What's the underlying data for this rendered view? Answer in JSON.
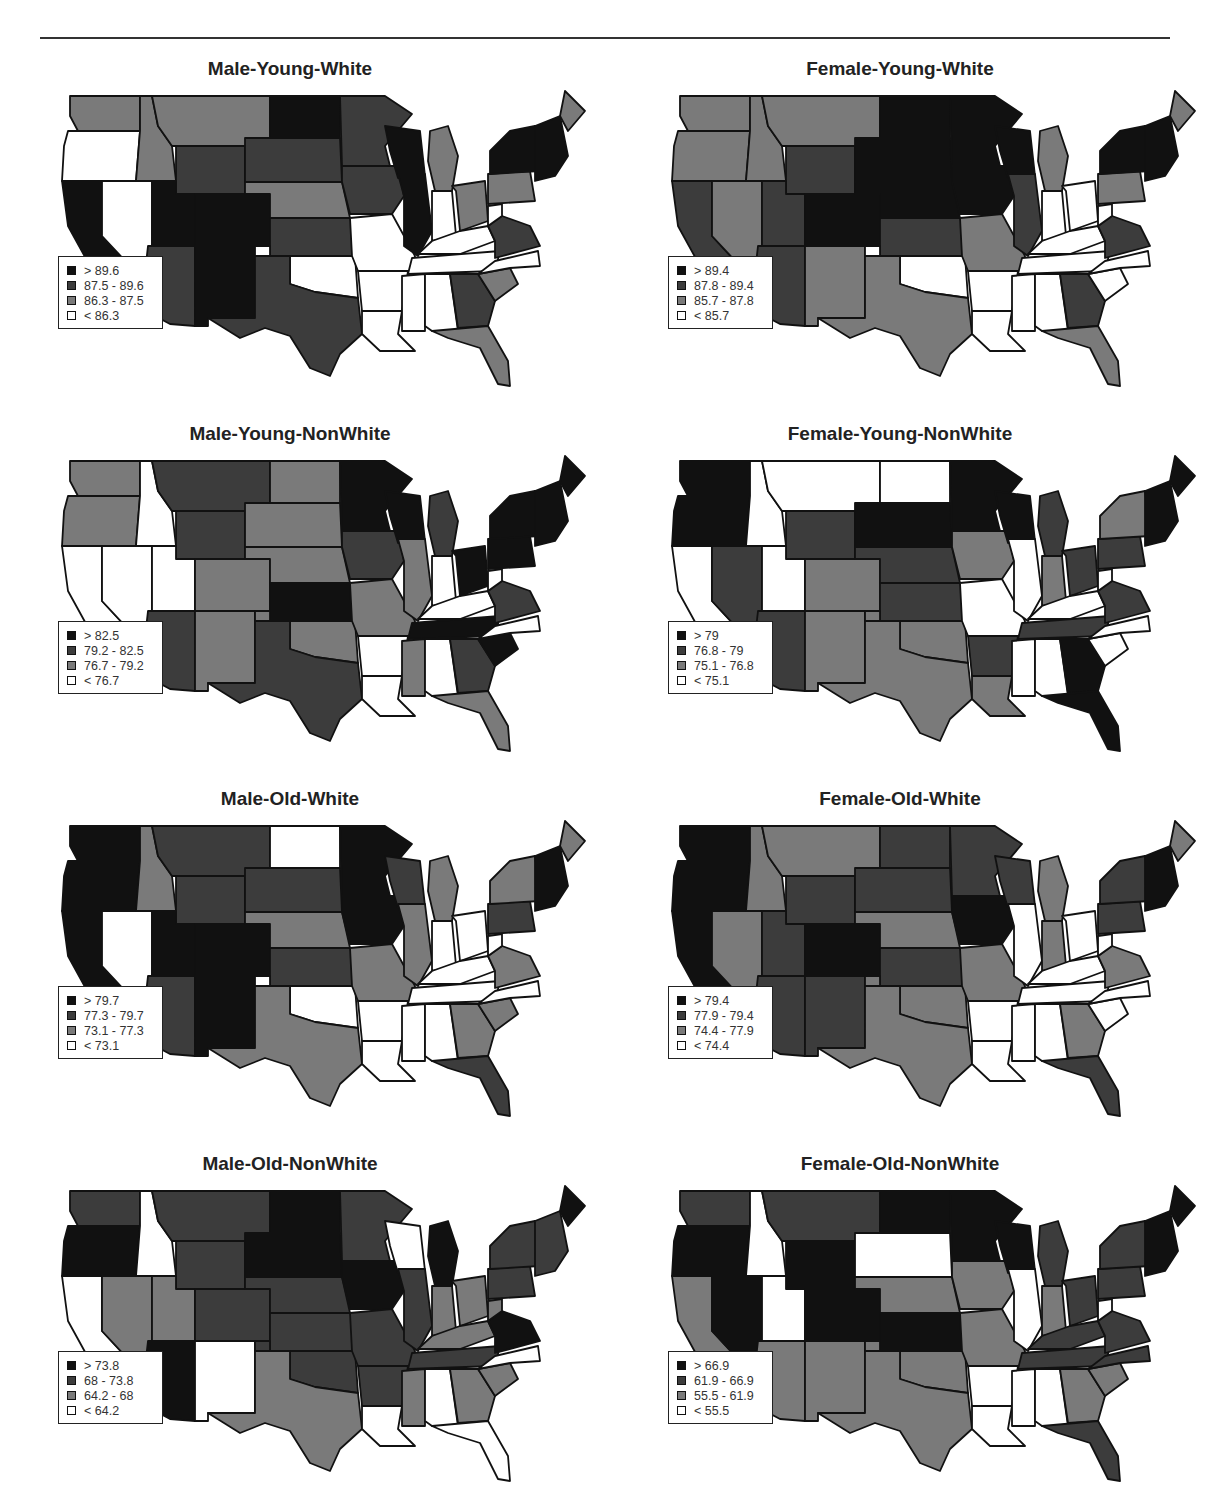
{
  "chart_data": [
    {
      "type": "choropleth-map",
      "title": "Male-Young-White",
      "region": "Contiguous United States (by state)",
      "legend": [
        "> 89.6",
        "87.5 - 89.6",
        "86.3 - 87.5",
        "< 86.3"
      ],
      "bins": [
        89.6,
        87.5,
        86.3
      ]
    },
    {
      "type": "choropleth-map",
      "title": "Female-Young-White",
      "region": "Contiguous United States (by state)",
      "legend": [
        "> 89.4",
        "87.8 - 89.4",
        "85.7 - 87.8",
        "< 85.7"
      ],
      "bins": [
        89.4,
        87.8,
        85.7
      ]
    },
    {
      "type": "choropleth-map",
      "title": "Male-Young-NonWhite",
      "region": "Contiguous United States (by state)",
      "legend": [
        "> 82.5",
        "79.2 - 82.5",
        "76.7 - 79.2",
        "< 76.7"
      ],
      "bins": [
        82.5,
        79.2,
        76.7
      ]
    },
    {
      "type": "choropleth-map",
      "title": "Female-Young-NonWhite",
      "region": "Contiguous United States (by state)",
      "legend": [
        "> 79",
        "76.8 - 79",
        "75.1 - 76.8",
        "< 75.1"
      ],
      "bins": [
        79,
        76.8,
        75.1
      ]
    },
    {
      "type": "choropleth-map",
      "title": "Male-Old-White",
      "region": "Contiguous United States (by state)",
      "legend": [
        "> 79.7",
        "77.3 - 79.7",
        "73.1 - 77.3",
        "< 73.1"
      ],
      "bins": [
        79.7,
        77.3,
        73.1
      ]
    },
    {
      "type": "choropleth-map",
      "title": "Female-Old-White",
      "region": "Contiguous United States (by state)",
      "legend": [
        "> 79.4",
        "77.9 - 79.4",
        "74.4 - 77.9",
        "< 74.4"
      ],
      "bins": [
        79.4,
        77.9,
        74.4
      ]
    },
    {
      "type": "choropleth-map",
      "title": "Male-Old-NonWhite",
      "region": "Contiguous United States (by state)",
      "legend": [
        "> 73.8",
        "68 - 73.8",
        "64.2 - 68",
        "< 64.2"
      ],
      "bins": [
        73.8,
        68,
        64.2
      ]
    },
    {
      "type": "choropleth-map",
      "title": "Female-Old-NonWhite",
      "region": "Contiguous United States (by state)",
      "legend": [
        "> 66.9",
        "61.9 - 66.9",
        "55.5 - 61.9",
        "< 55.5"
      ],
      "bins": [
        66.9,
        61.9,
        55.5
      ]
    }
  ],
  "colors": {
    "class1": "#111111",
    "class2": "#3c3c3c",
    "class3": "#7a7a7a",
    "class4": "#ffffff",
    "border": "#111111"
  },
  "panels": [
    {
      "title": "Male-Young-White",
      "legend": [
        "> 89.6",
        "87.5 - 89.6",
        "86.3 - 87.5",
        "< 86.3"
      ],
      "states": {
        "WA": 3,
        "OR": 4,
        "CA": 1,
        "NV": 4,
        "ID": 3,
        "MT": 3,
        "WY": 2,
        "UT": 1,
        "CO": 1,
        "AZ": 2,
        "NM": 1,
        "ND": 1,
        "SD": 2,
        "NE": 3,
        "KS": 2,
        "OK": 4,
        "TX": 2,
        "MN": 2,
        "IA": 2,
        "MO": 4,
        "AR": 4,
        "LA": 4,
        "WI": 1,
        "IL": 1,
        "MI": 3,
        "IN": 4,
        "OH": 3,
        "KY": 4,
        "TN": 4,
        "MS": 4,
        "AL": 4,
        "GA": 2,
        "FL": 3,
        "SC": 3,
        "NC": 4,
        "VA": 2,
        "WV": 4,
        "PA": 3,
        "NY": 1,
        "NE_US": 1,
        "ME": 3
      }
    },
    {
      "title": "Female-Young-White",
      "legend": [
        "> 89.4",
        "87.8 - 89.4",
        "85.7 - 87.8",
        "< 85.7"
      ],
      "states": {
        "WA": 3,
        "OR": 3,
        "CA": 2,
        "NV": 3,
        "ID": 3,
        "MT": 3,
        "WY": 2,
        "UT": 2,
        "CO": 1,
        "AZ": 2,
        "NM": 3,
        "ND": 1,
        "SD": 1,
        "NE": 1,
        "KS": 2,
        "OK": 4,
        "TX": 3,
        "MN": 1,
        "IA": 1,
        "MO": 3,
        "AR": 4,
        "LA": 4,
        "WI": 1,
        "IL": 2,
        "MI": 3,
        "IN": 4,
        "OH": 4,
        "KY": 4,
        "TN": 4,
        "MS": 4,
        "AL": 4,
        "GA": 2,
        "FL": 3,
        "SC": 4,
        "NC": 4,
        "VA": 2,
        "WV": 4,
        "PA": 3,
        "NY": 1,
        "NE_US": 1,
        "ME": 3
      }
    },
    {
      "title": "Male-Young-NonWhite",
      "legend": [
        "> 82.5",
        "79.2 - 82.5",
        "76.7 - 79.2",
        "< 76.7"
      ],
      "states": {
        "WA": 3,
        "OR": 3,
        "CA": 4,
        "NV": 4,
        "ID": 4,
        "MT": 2,
        "WY": 2,
        "UT": 4,
        "CO": 3,
        "AZ": 2,
        "NM": 3,
        "ND": 3,
        "SD": 3,
        "NE": 3,
        "KS": 1,
        "OK": 3,
        "TX": 2,
        "MN": 1,
        "IA": 2,
        "MO": 3,
        "AR": 4,
        "LA": 4,
        "WI": 1,
        "IL": 3,
        "MI": 2,
        "IN": 4,
        "OH": 1,
        "KY": 4,
        "TN": 1,
        "MS": 3,
        "AL": 4,
        "GA": 2,
        "FL": 3,
        "SC": 1,
        "NC": 4,
        "VA": 2,
        "WV": 4,
        "PA": 1,
        "NY": 1,
        "NE_US": 1,
        "ME": 1
      }
    },
    {
      "title": "Female-Young-NonWhite",
      "legend": [
        "> 79",
        "76.8 - 79",
        "75.1 - 76.8",
        "< 75.1"
      ],
      "states": {
        "WA": 1,
        "OR": 1,
        "CA": 4,
        "NV": 2,
        "ID": 4,
        "MT": 4,
        "WY": 2,
        "UT": 4,
        "CO": 3,
        "AZ": 2,
        "NM": 3,
        "ND": 4,
        "SD": 1,
        "NE": 2,
        "KS": 2,
        "OK": 3,
        "TX": 3,
        "MN": 1,
        "IA": 3,
        "MO": 4,
        "AR": 2,
        "LA": 3,
        "WI": 1,
        "IL": 4,
        "MI": 2,
        "IN": 3,
        "OH": 2,
        "KY": 4,
        "TN": 2,
        "MS": 4,
        "AL": 4,
        "GA": 1,
        "FL": 1,
        "SC": 4,
        "NC": 4,
        "VA": 2,
        "WV": 4,
        "PA": 2,
        "NY": 3,
        "NE_US": 1,
        "ME": 1
      }
    },
    {
      "title": "Male-Old-White",
      "legend": [
        "> 79.7",
        "77.3 - 79.7",
        "73.1 - 77.3",
        "< 73.1"
      ],
      "states": {
        "WA": 1,
        "OR": 1,
        "CA": 1,
        "NV": 4,
        "ID": 3,
        "MT": 2,
        "WY": 2,
        "UT": 1,
        "CO": 1,
        "AZ": 2,
        "NM": 1,
        "ND": 4,
        "SD": 2,
        "NE": 3,
        "KS": 2,
        "OK": 4,
        "TX": 3,
        "MN": 1,
        "IA": 1,
        "MO": 3,
        "AR": 4,
        "LA": 4,
        "WI": 2,
        "IL": 3,
        "MI": 3,
        "IN": 4,
        "OH": 4,
        "KY": 4,
        "TN": 4,
        "MS": 4,
        "AL": 4,
        "GA": 3,
        "FL": 2,
        "SC": 3,
        "NC": 4,
        "VA": 3,
        "WV": 4,
        "PA": 2,
        "NY": 3,
        "NE_US": 1,
        "ME": 3
      }
    },
    {
      "title": "Female-Old-White",
      "legend": [
        "> 79.4",
        "77.9 - 79.4",
        "74.4 - 77.9",
        "< 74.4"
      ],
      "states": {
        "WA": 1,
        "OR": 1,
        "CA": 1,
        "NV": 3,
        "ID": 3,
        "MT": 3,
        "WY": 2,
        "UT": 2,
        "CO": 1,
        "AZ": 2,
        "NM": 2,
        "ND": 2,
        "SD": 2,
        "NE": 3,
        "KS": 2,
        "OK": 3,
        "TX": 3,
        "MN": 2,
        "IA": 1,
        "MO": 3,
        "AR": 4,
        "LA": 4,
        "WI": 2,
        "IL": 4,
        "MI": 3,
        "IN": 3,
        "OH": 4,
        "KY": 4,
        "TN": 4,
        "MS": 4,
        "AL": 4,
        "GA": 3,
        "FL": 2,
        "SC": 4,
        "NC": 4,
        "VA": 3,
        "WV": 4,
        "PA": 2,
        "NY": 2,
        "NE_US": 1,
        "ME": 3
      }
    },
    {
      "title": "Male-Old-NonWhite",
      "legend": [
        "> 73.8",
        "68 - 73.8",
        "64.2 - 68",
        "< 64.2"
      ],
      "states": {
        "WA": 2,
        "OR": 1,
        "CA": 4,
        "NV": 3,
        "ID": 4,
        "MT": 2,
        "WY": 2,
        "UT": 3,
        "CO": 2,
        "AZ": 1,
        "NM": 4,
        "ND": 1,
        "SD": 1,
        "NE": 2,
        "KS": 2,
        "OK": 2,
        "TX": 3,
        "MN": 2,
        "IA": 1,
        "MO": 2,
        "AR": 2,
        "LA": 4,
        "WI": 4,
        "IL": 2,
        "MI": 1,
        "IN": 3,
        "OH": 3,
        "KY": 3,
        "TN": 2,
        "MS": 3,
        "AL": 4,
        "GA": 3,
        "FL": 4,
        "SC": 3,
        "NC": 4,
        "VA": 1,
        "WV": 3,
        "PA": 2,
        "NY": 2,
        "NE_US": 2,
        "ME": 1
      }
    },
    {
      "title": "Female-Old-NonWhite",
      "legend": [
        "> 66.9",
        "61.9 - 66.9",
        "55.5 - 61.9",
        "< 55.5"
      ],
      "states": {
        "WA": 2,
        "OR": 1,
        "CA": 3,
        "NV": 1,
        "ID": 4,
        "MT": 2,
        "WY": 1,
        "UT": 4,
        "CO": 1,
        "AZ": 3,
        "NM": 3,
        "ND": 1,
        "SD": 4,
        "NE": 3,
        "KS": 1,
        "OK": 3,
        "TX": 3,
        "MN": 1,
        "IA": 3,
        "MO": 3,
        "AR": 4,
        "LA": 4,
        "WI": 1,
        "IL": 4,
        "MI": 2,
        "IN": 3,
        "OH": 2,
        "KY": 2,
        "TN": 2,
        "MS": 4,
        "AL": 4,
        "GA": 3,
        "FL": 2,
        "SC": 3,
        "NC": 2,
        "VA": 2,
        "WV": 4,
        "PA": 2,
        "NY": 2,
        "NE_US": 1,
        "ME": 1
      }
    }
  ]
}
